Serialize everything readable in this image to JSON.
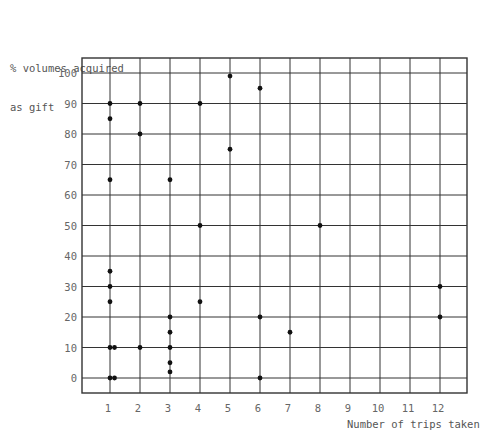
{
  "chart_data": {
    "type": "scatter",
    "title": "",
    "xlabel": "Number of trips taken",
    "ylabel": "% volumes acquired as gift",
    "ylabel_lines": [
      "% volumes acquired",
      "as gift"
    ],
    "xlim": [
      0,
      13
    ],
    "ylim": [
      -5,
      105
    ],
    "x_ticks": [
      1,
      2,
      3,
      4,
      5,
      6,
      7,
      8,
      9,
      10,
      11,
      12
    ],
    "y_ticks": [
      0,
      10,
      20,
      30,
      40,
      50,
      60,
      70,
      80,
      90,
      100
    ],
    "grid": true,
    "legend": null,
    "points": [
      {
        "x": 1,
        "y": 0
      },
      {
        "x": 1.15,
        "y": 0
      },
      {
        "x": 1,
        "y": 10
      },
      {
        "x": 1.15,
        "y": 10
      },
      {
        "x": 1,
        "y": 25
      },
      {
        "x": 1,
        "y": 30
      },
      {
        "x": 1,
        "y": 35
      },
      {
        "x": 1,
        "y": 65
      },
      {
        "x": 1,
        "y": 85
      },
      {
        "x": 1,
        "y": 90
      },
      {
        "x": 2,
        "y": 10
      },
      {
        "x": 2,
        "y": 80
      },
      {
        "x": 2,
        "y": 90
      },
      {
        "x": 3,
        "y": 2
      },
      {
        "x": 3,
        "y": 5
      },
      {
        "x": 3,
        "y": 10
      },
      {
        "x": 3,
        "y": 15
      },
      {
        "x": 3,
        "y": 20
      },
      {
        "x": 3,
        "y": 65
      },
      {
        "x": 4,
        "y": 25
      },
      {
        "x": 4,
        "y": 50
      },
      {
        "x": 4,
        "y": 90
      },
      {
        "x": 5,
        "y": 75
      },
      {
        "x": 5,
        "y": 99
      },
      {
        "x": 6,
        "y": 0
      },
      {
        "x": 6,
        "y": 20
      },
      {
        "x": 6,
        "y": 95
      },
      {
        "x": 7,
        "y": 15
      },
      {
        "x": 8,
        "y": 50
      },
      {
        "x": 12,
        "y": 20
      },
      {
        "x": 12,
        "y": 30
      }
    ]
  },
  "colors": {
    "grid": "#333333",
    "point": "#111111",
    "text": "#555555"
  }
}
